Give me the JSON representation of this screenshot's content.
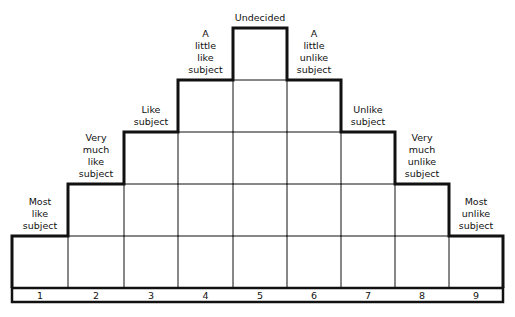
{
  "diagram": {
    "columns": [
      {
        "number": "1",
        "label": "Most\nlike\nsubject",
        "height_rows": 1
      },
      {
        "number": "2",
        "label": "Very\nmuch\nlike\nsubject",
        "height_rows": 2
      },
      {
        "number": "3",
        "label": "Like\nsubject",
        "height_rows": 3
      },
      {
        "number": "4",
        "label": "A\nlittle\nlike\nsubject",
        "height_rows": 4
      },
      {
        "number": "5",
        "label": "Undecided",
        "height_rows": 5
      },
      {
        "number": "6",
        "label": "A\nlittle\nunlike\nsubject",
        "height_rows": 4
      },
      {
        "number": "7",
        "label": "Unlike\nsubject",
        "height_rows": 3
      },
      {
        "number": "8",
        "label": "Very\nmuch\nunlike\nsubject",
        "height_rows": 2
      },
      {
        "number": "9",
        "label": "Most\nunlike\nsubject",
        "height_rows": 1
      }
    ],
    "colors": {
      "line": "#111111",
      "background": "#ffffff"
    }
  }
}
